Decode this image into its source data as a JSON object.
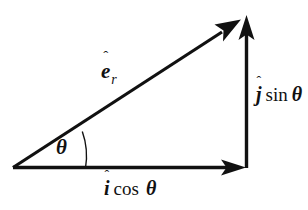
{
  "figure": {
    "kind": "vector-decomposition-diagram",
    "background_color": "#ffffff",
    "ink_color": "#111111",
    "line_width_px": 3,
    "arc_line_width_px": 1.3
  },
  "labels": {
    "resultant": {
      "name": "e-hat-r",
      "base": "e",
      "hat": "ˆ",
      "subscript": "r"
    },
    "vertical_component": {
      "name": "j-hat sin theta",
      "base": "j",
      "hat": "ˆ",
      "operator": "sin",
      "angle": "θ"
    },
    "horizontal_component": {
      "name": "i-hat cos theta",
      "base": "i",
      "hat": "ˆ",
      "operator": "cos",
      "angle": "θ"
    },
    "angle": {
      "name": "theta",
      "symbol": "θ"
    }
  },
  "geometry": {
    "origin": {
      "x": 13,
      "y": 168
    },
    "corner": {
      "x": 246,
      "y": 168
    },
    "apex": {
      "x": 244,
      "y": 17
    },
    "arc_radius": 73,
    "angle_degrees": 33
  }
}
